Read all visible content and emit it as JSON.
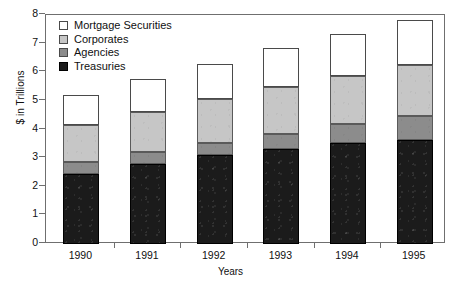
{
  "chart_data": {
    "type": "bar",
    "stacked": true,
    "title": "",
    "subtitle": "",
    "xlabel": "Years",
    "ylabel": "$ in Trillions",
    "categories": [
      "1990",
      "1991",
      "1992",
      "1993",
      "1994",
      "1995"
    ],
    "ylim": [
      0,
      8
    ],
    "yticks": [
      0,
      1,
      2,
      3,
      4,
      5,
      6,
      7,
      8
    ],
    "ytick_labels": [
      "0",
      "1",
      "2",
      "3",
      "4",
      "5",
      "6",
      "7",
      "8"
    ],
    "grid": false,
    "legend_position": "top-left",
    "series": [
      {
        "name": "Treasuries",
        "color": "#1b1b1b",
        "values": [
          2.45,
          2.78,
          3.1,
          3.33,
          3.52,
          3.65
        ]
      },
      {
        "name": "Agencies",
        "color": "#8c8c8c",
        "values": [
          0.42,
          0.44,
          0.42,
          0.52,
          0.68,
          0.82
        ]
      },
      {
        "name": "Corporates",
        "color": "#c6c6c6",
        "values": [
          1.3,
          1.38,
          1.53,
          1.65,
          1.68,
          1.78
        ]
      },
      {
        "name": "Mortgage Securities",
        "color": "#ffffff",
        "values": [
          1.03,
          1.15,
          1.25,
          1.33,
          1.47,
          1.58
        ]
      }
    ],
    "cumulative_tops": {
      "treasuries": [
        2.45,
        2.78,
        3.1,
        3.33,
        3.52,
        3.65
      ],
      "agencies": [
        2.87,
        3.22,
        3.52,
        3.85,
        4.2,
        4.47
      ],
      "corporates": [
        4.17,
        4.6,
        5.05,
        5.5,
        5.88,
        6.25
      ],
      "mortgage": [
        5.2,
        5.75,
        6.3,
        6.83,
        7.35,
        7.83
      ]
    },
    "totals": [
      5.2,
      5.75,
      6.3,
      6.83,
      7.35,
      7.83
    ]
  },
  "legend": {
    "entries": [
      {
        "label": "Mortgage Securities",
        "key": "mortgage",
        "color": "#ffffff"
      },
      {
        "label": "Corporates",
        "key": "corporates",
        "color": "#c6c6c6"
      },
      {
        "label": "Agencies",
        "key": "agencies",
        "color": "#8c8c8c"
      },
      {
        "label": "Treasuries",
        "key": "treasuries",
        "color": "#1b1b1b"
      }
    ]
  },
  "axes": {
    "y_title": "$ in Trillions",
    "x_title": "Years"
  }
}
